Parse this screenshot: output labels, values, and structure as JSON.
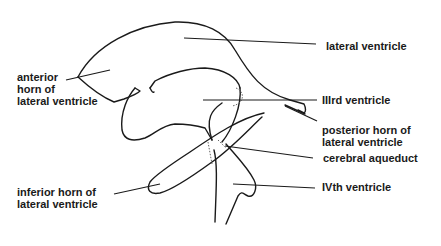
{
  "diagram": {
    "stroke_color": "#1a1a1a",
    "background": "#ffffff",
    "labels": {
      "lateral_ventricle": "lateral ventricle",
      "anterior_horn": [
        "anterior",
        "horn of",
        "lateral ventricle"
      ],
      "third_ventricle": "IIIrd ventricle",
      "posterior_horn": [
        "posterior horn of",
        "lateral ventricle"
      ],
      "cerebral_aqueduct": "cerebral aqueduct",
      "inferior_horn": [
        "inferior horn of",
        "lateral ventricle"
      ],
      "fourth_ventricle": "IVth ventricle"
    }
  }
}
